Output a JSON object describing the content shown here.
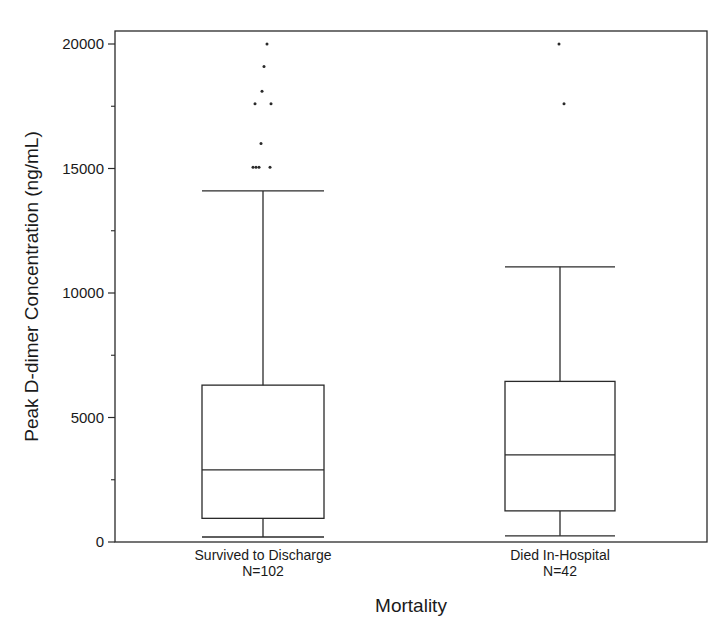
{
  "chart_data": {
    "type": "box",
    "title": "",
    "xlabel": "Mortality",
    "ylabel": "Peak D-dimer Concentration (ng/mL)",
    "ylim": [
      0,
      20000
    ],
    "yticks": [
      0,
      5000,
      10000,
      15000,
      20000
    ],
    "ytick_labels": [
      "0",
      "5000",
      "10000",
      "15000",
      "20000"
    ],
    "minor_yticks": [
      2500,
      7500,
      12500,
      17500
    ],
    "grid": false,
    "legend": null,
    "categories": [
      "Survived to Discharge",
      "Died In-Hospital"
    ],
    "category_n_labels": [
      "N=102",
      "N=42"
    ],
    "series": [
      {
        "name": "Survived to Discharge",
        "n": 102,
        "whisker_low": 200,
        "q1": 950,
        "median": 2900,
        "q3": 6300,
        "whisker_high": 14100,
        "outliers": [
          20000,
          19100,
          18100,
          17600,
          17600,
          16000,
          15050,
          15050,
          15050,
          15050
        ]
      },
      {
        "name": "Died In-Hospital",
        "n": 42,
        "whisker_low": 250,
        "q1": 1250,
        "median": 3500,
        "q3": 6450,
        "whisker_high": 11050,
        "outliers": [
          20000,
          17600
        ]
      }
    ]
  },
  "colors": {
    "line": "#2a2a2a",
    "background": "#ffffff"
  }
}
